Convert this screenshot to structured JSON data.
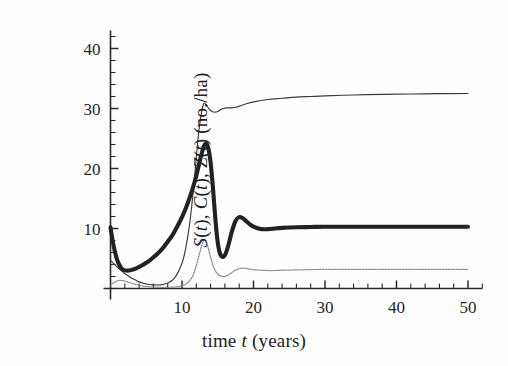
{
  "chart_data": {
    "type": "line",
    "title": "",
    "xlabel": "time t (years)",
    "ylabel": "S(t), C(t), Z(t) (no./ha)",
    "xlabel_parts": {
      "pre": "time ",
      "italic": "t",
      "post": " (years)"
    },
    "ylabel_parts": {
      "s_var": "S",
      "c_var": "C",
      "z_var": "Z",
      "arg": "t",
      "units": "(no./ha)",
      "full": "S(t), C(t), Z(t) (no./ha)"
    },
    "xlim": [
      0,
      52
    ],
    "ylim": [
      0,
      43
    ],
    "xticks": [
      10,
      20,
      30,
      40,
      50
    ],
    "xtick_labels": [
      "10",
      "20",
      "30",
      "40",
      "50"
    ],
    "xtick_minor_step": 2,
    "yticks": [
      10,
      20,
      30,
      40
    ],
    "ytick_labels": [
      "10",
      "20",
      "30",
      "40"
    ],
    "ytick_minor_step": 2,
    "grid": false,
    "legend": "none",
    "axis_color": "#2b2b2b",
    "series": [
      {
        "name": "S(t)",
        "style": "thin-solid",
        "color": "#3a3a3a",
        "linewidth": 1.15,
        "x": [
          0,
          0.5,
          1,
          1.5,
          2,
          2.5,
          3,
          3.5,
          4,
          5,
          6,
          7,
          8,
          9,
          10,
          10.5,
          11,
          11.5,
          12,
          12.3,
          12.6,
          12.9,
          13.1,
          13.4,
          13.8,
          14.2,
          14.6,
          15,
          15.4,
          15.8,
          16.2,
          16.6,
          17,
          17.5,
          18,
          19,
          20,
          22,
          24,
          26,
          28,
          30,
          34,
          38,
          42,
          46,
          50
        ],
        "y": [
          4.7,
          4.1,
          3.5,
          3.0,
          2.5,
          2.1,
          1.7,
          1.4,
          1.1,
          0.75,
          0.6,
          0.6,
          0.9,
          1.8,
          4.2,
          6.6,
          10.2,
          15.3,
          21.8,
          25.6,
          28.4,
          30.3,
          30.9,
          30.6,
          29.9,
          29.5,
          29.4,
          29.5,
          29.8,
          30.0,
          30.1,
          30.1,
          30.1,
          30.2,
          30.4,
          30.8,
          31.1,
          31.5,
          31.7,
          31.9,
          32.0,
          32.1,
          32.25,
          32.35,
          32.42,
          32.47,
          32.5
        ]
      },
      {
        "name": "C(t)",
        "style": "thick-solid",
        "color": "#222222",
        "linewidth": 4.1,
        "x": [
          0,
          0.3,
          0.6,
          0.9,
          1.2,
          1.5,
          1.8,
          2.2,
          2.6,
          3,
          3.5,
          4,
          4.5,
          5,
          5.5,
          6,
          6.5,
          7,
          7.5,
          8,
          8.5,
          9,
          9.5,
          10,
          10.5,
          11,
          11.5,
          12,
          12.4,
          12.8,
          13.1,
          13.4,
          13.7,
          14,
          14.3,
          14.6,
          14.9,
          15.2,
          15.5,
          15.8,
          16.1,
          16.5,
          17,
          17.5,
          18,
          18.5,
          19,
          19.5,
          20,
          21,
          22,
          23,
          24,
          26,
          28,
          30,
          34,
          38,
          42,
          46,
          50
        ],
        "y": [
          10.2,
          8.0,
          6.2,
          4.9,
          4.0,
          3.4,
          3.1,
          3.0,
          3.0,
          3.1,
          3.3,
          3.6,
          3.9,
          4.3,
          4.7,
          5.2,
          5.7,
          6.3,
          7.0,
          7.8,
          8.6,
          9.6,
          10.7,
          11.9,
          13.3,
          14.9,
          16.7,
          18.8,
          20.8,
          22.7,
          23.8,
          24.1,
          23.3,
          21.0,
          17.2,
          12.6,
          8.6,
          6.3,
          5.4,
          5.3,
          5.8,
          7.3,
          9.6,
          11.3,
          11.9,
          11.7,
          11.2,
          10.7,
          10.3,
          9.9,
          9.9,
          10.0,
          10.1,
          10.2,
          10.25,
          10.3,
          10.3,
          10.3,
          10.3,
          10.3,
          10.3
        ]
      },
      {
        "name": "Z(t)",
        "style": "thin-dotted",
        "color": "#8d8d8d",
        "linewidth": 1.25,
        "x": [
          0,
          0.4,
          0.8,
          1.2,
          1.6,
          2,
          2.5,
          3,
          3.5,
          4,
          5,
          6,
          7,
          8,
          9,
          10,
          10.5,
          11,
          11.5,
          12,
          12.4,
          12.8,
          13.1,
          13.4,
          13.7,
          14,
          14.3,
          14.6,
          15,
          15.4,
          15.8,
          16.2,
          16.8,
          17.4,
          18,
          18.6,
          19.2,
          20,
          21,
          22,
          23,
          24,
          26,
          28,
          30,
          34,
          38,
          42,
          46,
          50
        ],
        "y": [
          0.55,
          0.9,
          1.2,
          1.35,
          1.35,
          1.25,
          1.05,
          0.85,
          0.7,
          0.55,
          0.35,
          0.25,
          0.2,
          0.2,
          0.25,
          0.45,
          0.7,
          1.2,
          2.1,
          3.8,
          5.6,
          7.3,
          8.0,
          7.7,
          6.6,
          5.2,
          4.0,
          3.1,
          2.4,
          2.1,
          2.0,
          2.1,
          2.5,
          3.0,
          3.3,
          3.4,
          3.3,
          3.15,
          3.05,
          3.0,
          3.0,
          3.05,
          3.1,
          3.15,
          3.2,
          3.2,
          3.2,
          3.2,
          3.2,
          3.2
        ]
      }
    ]
  }
}
